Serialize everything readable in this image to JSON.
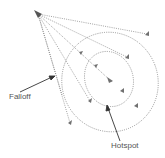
{
  "diagram": {
    "type": "spotlight-cone",
    "labels": {
      "falloff": "Falloff",
      "hotspot": "Hotspot"
    },
    "colors": {
      "line": "#8a8a8a",
      "marker": "#707070",
      "arrow": "#333333",
      "text": "#555555"
    }
  }
}
